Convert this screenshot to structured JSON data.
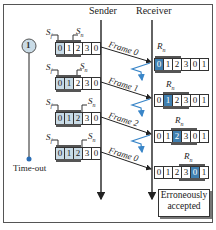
{
  "header": {
    "sender_label": "Sender",
    "receiver_label": "Receiver"
  },
  "timer": {
    "start_symbol": "1",
    "timeout_label": "Time-out"
  },
  "sender_windows": [
    {
      "sf_label": "S",
      "sf_sub": "f",
      "sn_label": "S",
      "sn_sub": "n",
      "cells": [
        "0",
        "1",
        "2",
        "3",
        "0"
      ],
      "outstanding": [
        0
      ],
      "sf_index": 0,
      "sn_index": 1
    },
    {
      "sf_label": "S",
      "sf_sub": "f",
      "sn_label": "S",
      "sn_sub": "n",
      "cells": [
        "0",
        "1",
        "2",
        "3",
        "0"
      ],
      "outstanding": [
        0,
        1
      ],
      "sf_index": 0,
      "sn_index": 2
    },
    {
      "sf_label": "S",
      "sf_sub": "f",
      "sn_label": "S",
      "sn_sub": "n",
      "cells": [
        "0",
        "1",
        "2",
        "3",
        "0"
      ],
      "outstanding": [
        0,
        1,
        2
      ],
      "sf_index": 0,
      "sn_index": 3
    },
    {
      "sf_label": "S",
      "sf_sub": "f",
      "sn_label": "S",
      "sn_sub": "n",
      "cells": [
        "0",
        "1",
        "2",
        "3",
        "0"
      ],
      "outstanding": [
        0,
        1,
        2
      ],
      "sf_index": 0,
      "sn_index": 3
    }
  ],
  "receiver_windows": [
    {
      "rn_label": "R",
      "rn_sub": "n",
      "cells": [
        "0",
        "1",
        "2",
        "3",
        "0",
        "1"
      ],
      "rn_index": 0
    },
    {
      "rn_label": "R",
      "rn_sub": "n",
      "cells": [
        "0",
        "1",
        "2",
        "3",
        "0",
        "1"
      ],
      "rn_index": 1
    },
    {
      "rn_label": "R",
      "rn_sub": "n",
      "cells": [
        "0",
        "1",
        "2",
        "3",
        "0",
        "1"
      ],
      "rn_index": 2
    },
    {
      "rn_label": "R",
      "rn_sub": "n",
      "cells": [
        "0",
        "1",
        "2",
        "3",
        "0",
        "1"
      ],
      "rn_index": 4
    }
  ],
  "frames": [
    {
      "label": "Frame 0",
      "ack_lost": true
    },
    {
      "label": "Frame 1",
      "ack_lost": true
    },
    {
      "label": "Frame 2",
      "ack_lost": true
    },
    {
      "label": "Frame 0",
      "ack_lost": false
    }
  ],
  "note": {
    "line1": "Erroneously",
    "line2": "accepted"
  },
  "colors": {
    "accent_blue": "#3f7fb0",
    "outstanding_fill": "#c9dbe6",
    "lost_ack": "#3a86c8",
    "line": "#222222"
  }
}
